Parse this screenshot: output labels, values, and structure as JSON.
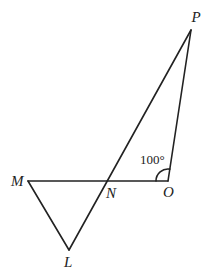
{
  "diagram": {
    "points": {
      "P": {
        "label": "P",
        "x": 191,
        "y": 30,
        "lx": 196,
        "ly": 22
      },
      "M": {
        "label": "M",
        "x": 28,
        "y": 181,
        "lx": 11,
        "ly": 186
      },
      "N": {
        "label": "N",
        "x": 108,
        "y": 181,
        "lx": 106,
        "ly": 198
      },
      "O": {
        "label": "O",
        "x": 168,
        "y": 181,
        "lx": 163,
        "ly": 197
      },
      "L": {
        "label": "L",
        "x": 69,
        "y": 250,
        "lx": 64,
        "ly": 267
      }
    },
    "segments": [
      [
        "M",
        "O"
      ],
      [
        "M",
        "L"
      ],
      [
        "L",
        "P"
      ],
      [
        "P",
        "O"
      ]
    ],
    "angle": {
      "vertex": "O",
      "label": "100°",
      "lx": 140,
      "ly": 164
    }
  }
}
